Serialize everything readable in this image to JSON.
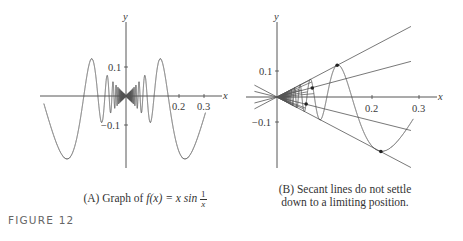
{
  "figure": {
    "label": "FIGURE 12"
  },
  "panel_a": {
    "caption_prefix": "(A) Graph of ",
    "caption_func": "f(x) = x sin",
    "caption_frac_num": "1",
    "caption_frac_den": "x",
    "x_axis_label": "x",
    "y_axis_label": "y",
    "x_ticks": [
      "0.2",
      "0.3"
    ],
    "y_ticks": [
      "0.1",
      "−0.1"
    ]
  },
  "panel_b": {
    "caption_line1": "(B) Secant lines do not settle",
    "caption_line2": "down to a limiting position.",
    "x_axis_label": "x",
    "y_axis_label": "y",
    "x_ticks": [
      "0.2",
      "0.3"
    ],
    "y_ticks": [
      "0.1",
      "−0.1"
    ]
  },
  "chart_data": [
    {
      "type": "line",
      "title": "(A) Graph of f(x) = x sin(1/x)",
      "function": "x*sin(1/x)",
      "xlabel": "x",
      "ylabel": "y",
      "xlim": [
        -0.31,
        0.3
      ],
      "ylim": [
        -0.23,
        0.2
      ],
      "x_ticks": [
        0.2,
        0.3
      ],
      "y_ticks": [
        0.1,
        -0.1
      ],
      "grid": false,
      "color": "#555555"
    },
    {
      "type": "line",
      "title": "(B) Secant lines do not settle down to a limiting position.",
      "function": "x*sin(1/x)",
      "xlabel": "x",
      "ylabel": "y",
      "xlim": [
        0,
        0.29
      ],
      "ylim": [
        -0.25,
        0.3
      ],
      "x_ticks": [
        0.2,
        0.3
      ],
      "y_ticks": [
        0.1,
        -0.1
      ],
      "grid": false,
      "secant_lines": {
        "through_origin": true,
        "slopes": [
          0.99,
          0.5,
          -0.47,
          -0.99
        ],
        "marked_points": [
          {
            "x": 0.128,
            "y": 0.127
          },
          {
            "x": 0.075,
            "y": 0.036
          },
          {
            "x": 0.062,
            "y": -0.028
          },
          {
            "x": 0.221,
            "y": -0.218
          }
        ],
        "fan_count": 14
      },
      "color": "#555555"
    }
  ]
}
